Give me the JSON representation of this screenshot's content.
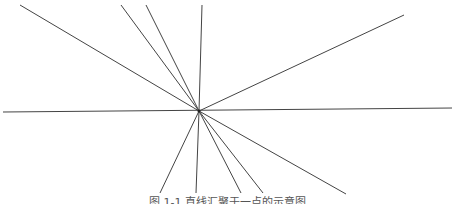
{
  "figure": {
    "center": {
      "x": 199,
      "y": 111
    },
    "stroke_color": "#444444",
    "stroke_width": 1,
    "lines": [
      {
        "id": "horizontal",
        "x1": 3,
        "y1": 112,
        "x2": 452,
        "y2": 108
      },
      {
        "id": "upper-left-far",
        "x1": 20,
        "y1": 5,
        "x2": 199,
        "y2": 111
      },
      {
        "id": "upper-left-mid",
        "x1": 121,
        "y1": 5,
        "x2": 199,
        "y2": 111
      },
      {
        "id": "upper-left-near",
        "x1": 146,
        "y1": 5,
        "x2": 199,
        "y2": 111
      },
      {
        "id": "upper-vertical",
        "x1": 202,
        "y1": 5,
        "x2": 199,
        "y2": 111
      },
      {
        "id": "upper-right",
        "x1": 404,
        "y1": 15,
        "x2": 199,
        "y2": 111
      },
      {
        "id": "lower-left",
        "x1": 199,
        "y1": 111,
        "x2": 160,
        "y2": 193
      },
      {
        "id": "lower-vertical",
        "x1": 199,
        "y1": 111,
        "x2": 196,
        "y2": 193
      },
      {
        "id": "lower-right-near",
        "x1": 199,
        "y1": 111,
        "x2": 241,
        "y2": 193
      },
      {
        "id": "lower-right-mid",
        "x1": 199,
        "y1": 111,
        "x2": 263,
        "y2": 193
      },
      {
        "id": "lower-right-far",
        "x1": 199,
        "y1": 111,
        "x2": 346,
        "y2": 194
      }
    ],
    "caption": "图 1-1  直线汇聚于一点的示意图"
  }
}
